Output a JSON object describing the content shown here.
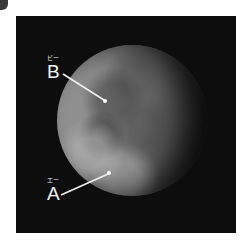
{
  "image": {
    "subject": "moon",
    "background_color": "#0d0d0d",
    "label_color": "#f2f2f2"
  },
  "labels": {
    "b": {
      "letter": "B",
      "ruby": "ビー"
    },
    "a": {
      "letter": "A",
      "ruby": "エー"
    }
  }
}
